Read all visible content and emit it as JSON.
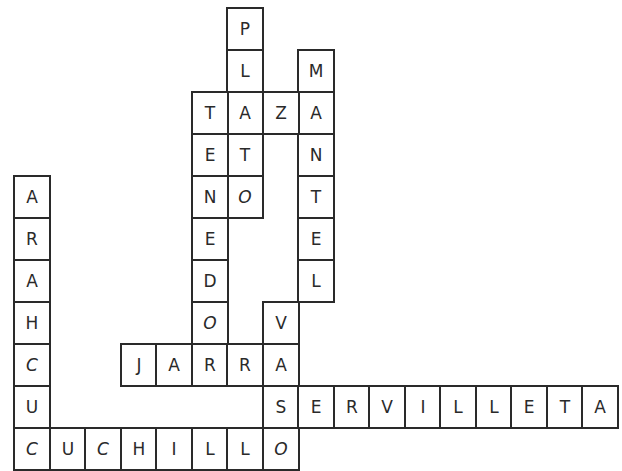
{
  "puzzle": {
    "type": "crossword",
    "grid": {
      "origin_x": 13,
      "origin_y": 7,
      "cell_width": 35.5,
      "cell_height": 42,
      "line_color": "#2a2a2a"
    },
    "words": [
      {
        "word": "PLATO",
        "direction": "down",
        "row": 0,
        "col": 6
      },
      {
        "word": "MANTEL",
        "direction": "down",
        "row": 1,
        "col": 8
      },
      {
        "word": "TAZA",
        "direction": "across",
        "row": 2,
        "col": 5
      },
      {
        "word": "TENEDOR",
        "direction": "down",
        "row": 2,
        "col": 5
      },
      {
        "word": "ARAHCUC",
        "direction": "down",
        "row": 4,
        "col": 0
      },
      {
        "word": "VASO",
        "direction": "down",
        "row": 7,
        "col": 7
      },
      {
        "word": "JARRA",
        "direction": "across",
        "row": 8,
        "col": 3
      },
      {
        "word": "SERVILLETA",
        "direction": "across",
        "row": 9,
        "col": 7
      },
      {
        "word": "CUCHILLO",
        "direction": "across",
        "row": 10,
        "col": 0
      }
    ]
  }
}
